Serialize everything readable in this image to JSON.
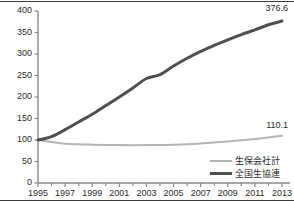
{
  "chart_data": {
    "type": "line",
    "title": "",
    "subtitle": "",
    "xlabel": "",
    "ylabel": "",
    "xlim": [
      1995,
      2013
    ],
    "ylim": [
      0,
      400
    ],
    "grid": false,
    "legend_position": "bottom-right",
    "x": [
      1995,
      1996,
      1997,
      1998,
      1999,
      2000,
      2001,
      2002,
      2003,
      2004,
      2005,
      2006,
      2007,
      2008,
      2009,
      2010,
      2011,
      2012,
      2013
    ],
    "y_ticks": [
      0,
      50,
      100,
      150,
      200,
      250,
      300,
      350,
      400
    ],
    "y_tick_labels": [
      "0",
      "50",
      "100",
      "150",
      "200",
      "250",
      "300",
      "350",
      "400"
    ],
    "x_ticks": [
      1995,
      1997,
      1999,
      2001,
      2003,
      2005,
      2007,
      2009,
      2011,
      2013
    ],
    "x_tick_labels": [
      "1995",
      "1997",
      "1999",
      "2001",
      "2003",
      "2005",
      "2007",
      "2009",
      "2011",
      "2013"
    ],
    "series": [
      {
        "name": "生保会社計",
        "color": "#b4b4b4",
        "width": 2,
        "end_label": "110.1",
        "values": [
          100.0,
          95.5,
          91.5,
          90.0,
          89.2,
          88.6,
          88.2,
          88.0,
          88.1,
          88.4,
          89.0,
          90.2,
          92.0,
          94.2,
          96.5,
          99.2,
          102.2,
          106.0,
          110.1
        ]
      },
      {
        "name": "全国生協連",
        "color": "#4f4f4f",
        "width": 3,
        "end_label": "376.6",
        "values": [
          100.0,
          108.0,
          124.0,
          142.0,
          160.0,
          180.0,
          200.0,
          221.0,
          243.0,
          252.0,
          272.0,
          290.0,
          306.0,
          320.0,
          333.0,
          345.0,
          356.0,
          368.0,
          376.6
        ]
      }
    ],
    "annotations": [
      {
        "name": "end-value-zenkoku",
        "text": "376.6",
        "series": "全国生協連",
        "x": 2013
      },
      {
        "name": "end-value-seiho",
        "text": "110.1",
        "series": "生保会社計",
        "x": 2013
      }
    ]
  }
}
